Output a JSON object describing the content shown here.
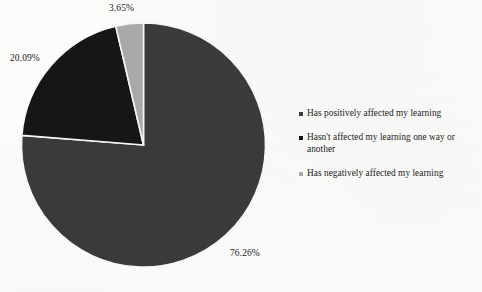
{
  "chart_data": {
    "type": "pie",
    "title": "",
    "subtitle": "",
    "xlabel": "",
    "ylabel": "",
    "legend_position": "right",
    "grid": false,
    "start_angle_deg": 0,
    "direction": "clockwise",
    "categories": [
      "Has positively affected my learning",
      "Hasn't affected my learning one way or another",
      "Has negatively affected my learning"
    ],
    "values": [
      76.26,
      20.09,
      3.65
    ],
    "data_labels": [
      "76.26%",
      "20.09%",
      "3.65%"
    ],
    "colors": [
      "#3a3a3a",
      "#161616",
      "#a9a9a9"
    ],
    "slices": [
      {
        "label": "Has positively affected my learning",
        "value": 76.26,
        "data_label": "76.26%",
        "color": "#3a3a3a"
      },
      {
        "label": "Hasn't affected my learning one way or another",
        "value": 20.09,
        "data_label": "20.09%",
        "color": "#161616"
      },
      {
        "label": "Has negatively affected my learning",
        "value": 3.65,
        "data_label": "3.65%",
        "color": "#a9a9a9"
      }
    ]
  },
  "labels": {
    "positive_pct": "76.26%",
    "neutral_pct": "20.09%",
    "negative_pct": "3.65%"
  },
  "legend": {
    "items": [
      {
        "label": "Has positively affected my learning",
        "color": "#3a3a3a"
      },
      {
        "label": "Hasn't affected my learning one way or another",
        "color": "#161616"
      },
      {
        "label": "Has negatively affected my learning",
        "color": "#a9a9a9"
      }
    ]
  },
  "colors": {
    "slice_positive": "#3a3a3a",
    "slice_neutral": "#161616",
    "slice_negative": "#a9a9a9",
    "slice_border": "#f6f5f3",
    "text": "#1b1b1b",
    "background": "#fdfdfc"
  }
}
